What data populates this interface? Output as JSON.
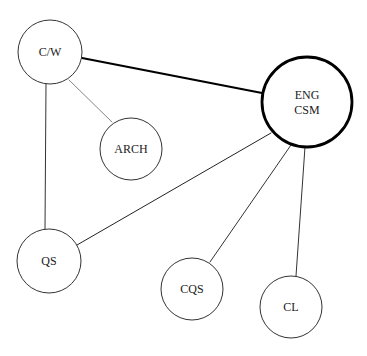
{
  "diagram": {
    "type": "network",
    "nodes": [
      {
        "id": "cw",
        "label_lines": [
          "C/W"
        ],
        "cx": 50,
        "cy": 52,
        "r": 32,
        "stroke_width": 1,
        "emphasis": false
      },
      {
        "id": "arch",
        "label_lines": [
          "ARCH"
        ],
        "cx": 131,
        "cy": 149,
        "r": 31,
        "stroke_width": 1,
        "emphasis": false
      },
      {
        "id": "eng",
        "label_lines": [
          "ENG",
          "CSM"
        ],
        "cx": 307,
        "cy": 102,
        "r": 45,
        "stroke_width": 2.8,
        "emphasis": true
      },
      {
        "id": "qs",
        "label_lines": [
          "QS"
        ],
        "cx": 49,
        "cy": 261,
        "r": 32,
        "stroke_width": 1,
        "emphasis": false
      },
      {
        "id": "cqs",
        "label_lines": [
          "CQS"
        ],
        "cx": 192,
        "cy": 289,
        "r": 31,
        "stroke_width": 1,
        "emphasis": false
      },
      {
        "id": "cl",
        "label_lines": [
          "CL"
        ],
        "cx": 291,
        "cy": 307,
        "r": 31,
        "stroke_width": 1,
        "emphasis": false
      }
    ],
    "edges": [
      {
        "from": "cw",
        "to": "eng",
        "weight": "strong",
        "x1": 82,
        "y1": 58,
        "x2": 262,
        "y2": 93,
        "stroke_width": 2.2,
        "color": "#000000"
      },
      {
        "from": "cw",
        "to": "arch",
        "weight": "weak",
        "x1": 69,
        "y1": 80,
        "x2": 112,
        "y2": 122,
        "stroke_width": 0.9,
        "color": "#777777"
      },
      {
        "from": "cw",
        "to": "qs",
        "weight": "normal",
        "x1": 46,
        "y1": 84,
        "x2": 45,
        "y2": 230,
        "stroke_width": 1,
        "color": "#333333"
      },
      {
        "from": "eng",
        "to": "qs",
        "weight": "normal",
        "x1": 271,
        "y1": 133,
        "x2": 77,
        "y2": 245,
        "stroke_width": 1,
        "color": "#222222"
      },
      {
        "from": "eng",
        "to": "cqs",
        "weight": "normal",
        "x1": 291,
        "y1": 145,
        "x2": 210,
        "y2": 262,
        "stroke_width": 1,
        "color": "#333333"
      },
      {
        "from": "eng",
        "to": "cl",
        "weight": "normal",
        "x1": 305,
        "y1": 147,
        "x2": 296,
        "y2": 276,
        "stroke_width": 1,
        "color": "#333333"
      }
    ],
    "colors": {
      "background": "#ffffff",
      "node_stroke": "#333333",
      "node_stroke_emphasis": "#000000",
      "text": "#1a1a1a"
    }
  }
}
